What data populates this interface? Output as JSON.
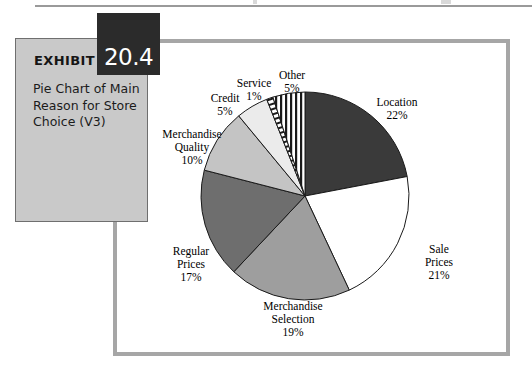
{
  "exhibit": {
    "label": "EXHIBIT",
    "number": "20.4",
    "description": "Pie Chart of Main Reason for Store Choice (V3)"
  },
  "colors": {
    "frame": "#a6a6a6",
    "caption_box": "#c9c9c9",
    "badge": "#2b2b2b",
    "page_rule": "#9a9a9a"
  },
  "chart_data": {
    "type": "pie",
    "title": "Pie Chart of Main Reason for Store Choice (V3)",
    "unit": "%",
    "legend": "none",
    "labels": [
      "Location",
      "Sale Prices",
      "Merchandise Selection",
      "Regular Prices",
      "Merchandise Quality",
      "Credit",
      "Service",
      "Other"
    ],
    "values": [
      22,
      21,
      19,
      17,
      10,
      5,
      1,
      5
    ],
    "slices": [
      {
        "name": "Location",
        "value": 22,
        "label": "Location\n22%",
        "fill": "#3a3a3a",
        "pattern": "solid"
      },
      {
        "name": "Sale Prices",
        "value": 21,
        "label": "Sale\nPrices\n21%",
        "fill": "#ffffff",
        "pattern": "solid"
      },
      {
        "name": "Merchandise Selection",
        "value": 19,
        "label": "Merchandise\nSelection\n19%",
        "fill": "#9e9e9e",
        "pattern": "solid"
      },
      {
        "name": "Regular Prices",
        "value": 17,
        "label": "Regular\nPrices\n17%",
        "fill": "#6e6e6e",
        "pattern": "solid"
      },
      {
        "name": "Merchandise Quality",
        "value": 10,
        "label": "Merchandise\nQuality\n10%",
        "fill": "#c4c4c4",
        "pattern": "solid"
      },
      {
        "name": "Credit",
        "value": 5,
        "label": "Credit\n5%",
        "fill": "#ebebeb",
        "pattern": "solid"
      },
      {
        "name": "Service",
        "value": 1,
        "label": "Service\n1%",
        "fill": "#ffffff",
        "pattern": "horizontal-hatch"
      },
      {
        "name": "Other",
        "value": 5,
        "label": "Other\n5%",
        "fill": "#ffffff",
        "pattern": "vertical-stripes"
      }
    ],
    "start_angle_deg": 0,
    "direction": "clockwise"
  }
}
